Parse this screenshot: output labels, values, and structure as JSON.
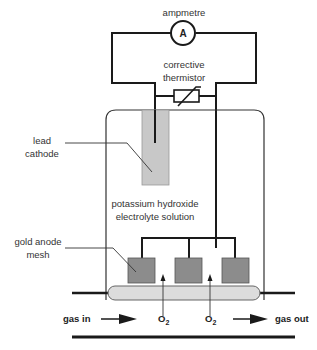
{
  "diagram": {
    "type": "oxygen electrode / fuel cell sensor schematic",
    "labels": {
      "ammeter": "ampmetre",
      "ammeter_symbol": "A",
      "thermistor_line1": "corrective",
      "thermistor_line2": "thermistor",
      "cathode_line1": "lead",
      "cathode_line2": "cathode",
      "electrolyte_line1": "potassium hydroxide",
      "electrolyte_line2": "electrolyte solution",
      "anode_line1": "gold anode",
      "anode_line2": "mesh",
      "gas_in": "gas in",
      "gas_out": "gas out",
      "o2_left": "O",
      "o2_left_sub": "2",
      "o2_right": "O",
      "o2_right_sub": "2"
    },
    "colors": {
      "line": "#1a1a1a",
      "cathode_fill": "#c8c8c8",
      "anode_fill": "#8c8c8c",
      "membrane_fill": "#dcdcdc",
      "cell_border": "#333333"
    },
    "anode_count": 3
  }
}
